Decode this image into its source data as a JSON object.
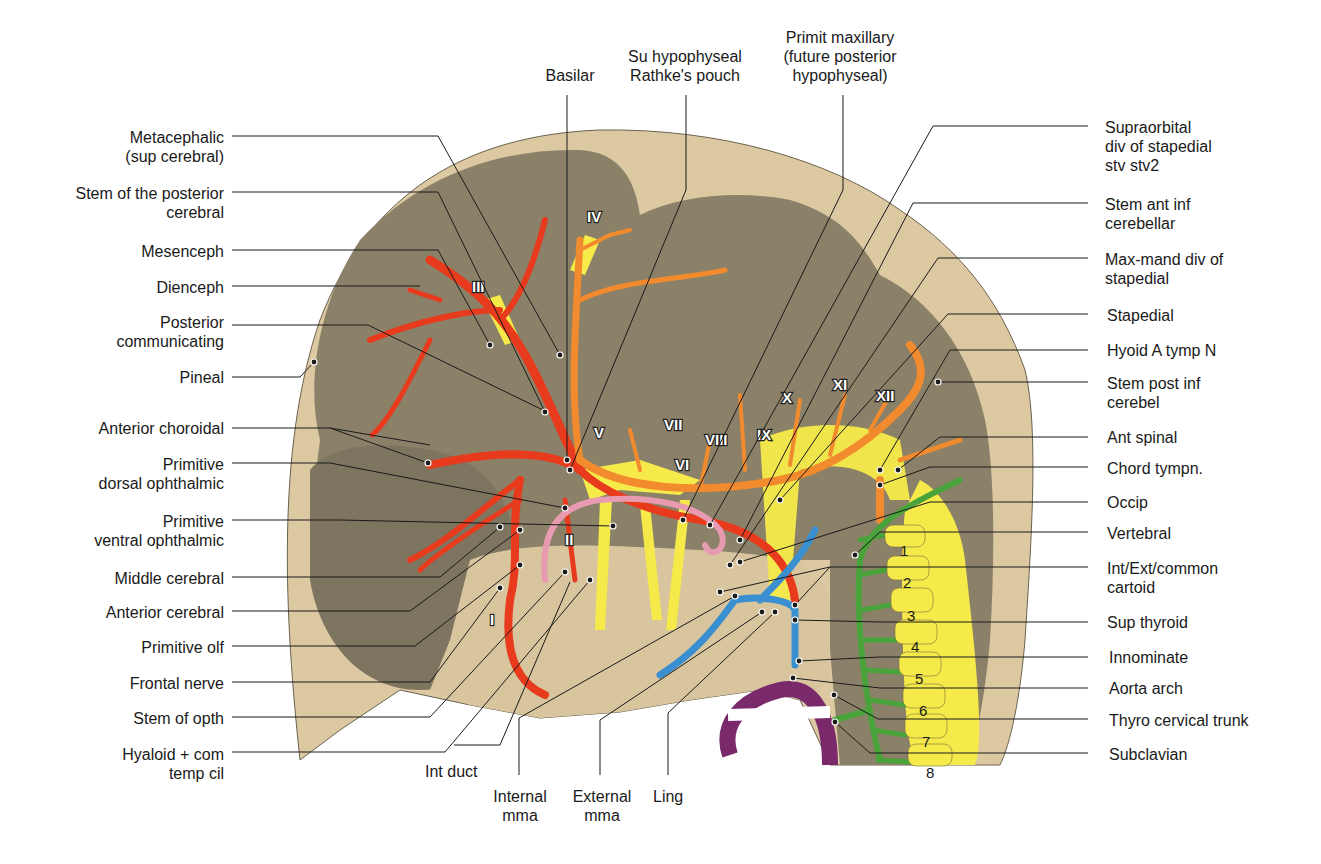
{
  "figure": {
    "colors": {
      "outer_tissue": "#d9c8a3",
      "brain": "#8a8168",
      "internal_carotid_system": "#e83a1c",
      "basilar_vertebral_system": "#f28a2e",
      "nerves": "#f2e84a",
      "hypophyseal": "#e89ab0",
      "external_carotid": "#3a8fd0",
      "vertebral_segmental": "#4aa33a",
      "aorta": "#7a2a6a",
      "leader_line": "#1a1a1a"
    }
  },
  "top_labels": [
    {
      "text": "Basilar"
    },
    {
      "text": "Su hypophyseal\nRathke's pouch"
    },
    {
      "text": "Primit maxillary\n(future posterior\nhypophyseal)"
    }
  ],
  "left_labels": [
    {
      "text": "Metacephalic\n(sup cerebral)"
    },
    {
      "text": "Stem of the posterior\ncerebral"
    },
    {
      "text": "Mesenceph"
    },
    {
      "text": "Dienceph"
    },
    {
      "text": "Posterior\ncommunicating"
    },
    {
      "text": "Pineal"
    },
    {
      "text": "Anterior choroidal"
    },
    {
      "text": "Primitive\ndorsal ophthalmic"
    },
    {
      "text": "Primitive\nventral ophthalmic"
    },
    {
      "text": "Middle cerebral"
    },
    {
      "text": "Anterior cerebral"
    },
    {
      "text": "Primitive olf"
    },
    {
      "text": "Frontal nerve"
    },
    {
      "text": "Stem of opth"
    },
    {
      "text": "Hyaloid + com\ntemp cil"
    }
  ],
  "right_labels": [
    {
      "text": "Supraorbital\ndiv of stapedial\nstv stv2"
    },
    {
      "text": "Stem ant inf\ncerebellar"
    },
    {
      "text": "Max-mand div of\nstapedial"
    },
    {
      "text": "Stapedial"
    },
    {
      "text": "Hyoid A tymp N"
    },
    {
      "text": "Stem post inf\ncerebel"
    },
    {
      "text": "Ant spinal"
    },
    {
      "text": "Chord tympn."
    },
    {
      "text": "Occip"
    },
    {
      "text": "Vertebral"
    },
    {
      "text": "Int/Ext/common\ncartoid"
    },
    {
      "text": "Sup thyroid"
    },
    {
      "text": "Innominate"
    },
    {
      "text": "Aorta arch"
    },
    {
      "text": "Thyro cervical trunk"
    },
    {
      "text": "Subclavian"
    }
  ],
  "bottom_labels": [
    {
      "text": "Int duct"
    },
    {
      "text": "Internal\nmma"
    },
    {
      "text": "External\nmma"
    },
    {
      "text": "Ling"
    }
  ],
  "cranial_nerves": [
    "I",
    "II",
    "III",
    "IV",
    "V",
    "VI",
    "VII",
    "VIII",
    "IX",
    "X",
    "XI",
    "XII"
  ],
  "somites": [
    "1",
    "2",
    "3",
    "4",
    "5",
    "6",
    "7",
    "8"
  ]
}
